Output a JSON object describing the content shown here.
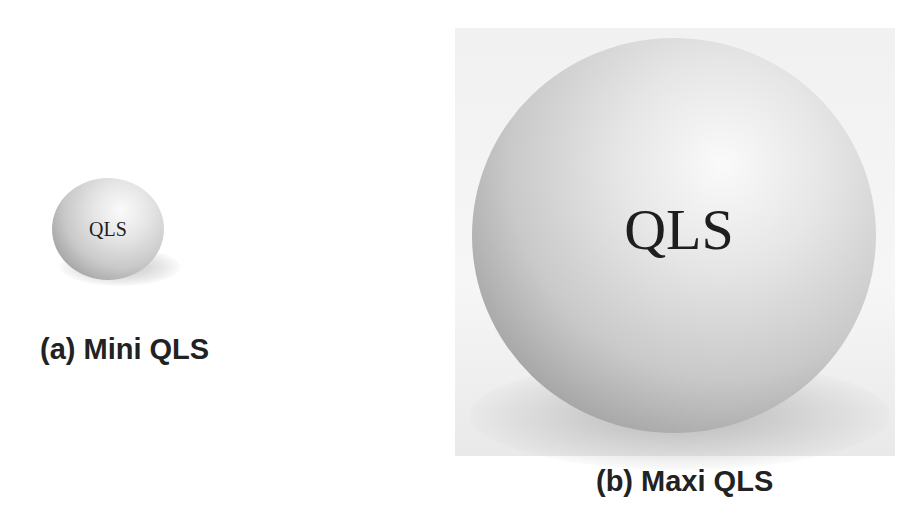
{
  "figure": {
    "panels": [
      {
        "id": "a",
        "sphere_label": "QLS",
        "caption": "(a) Mini QLS",
        "size": "small"
      },
      {
        "id": "b",
        "sphere_label": "QLS",
        "caption": "(b) Maxi QLS",
        "size": "large"
      }
    ],
    "colors": {
      "background": "#ffffff",
      "sphere_highlight": "#fafafa",
      "sphere_shade": "#7d7d7d",
      "text": "#222222"
    }
  }
}
